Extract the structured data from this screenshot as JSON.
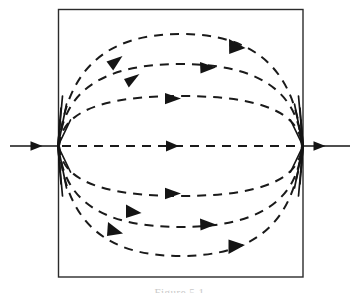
{
  "figure": {
    "name": "phase-portrait-heteroclinic",
    "title": "",
    "caption": "Figure 5.1",
    "background_color": "#ffffff",
    "stroke_color": "#1a1a1a",
    "border_color": "#2b2b2b",
    "caption_color": "#c9c9c9"
  },
  "frame": {
    "x": 58,
    "y": 9,
    "width": 245,
    "height": 268,
    "stroke_width": 1.4
  },
  "chart_data": {
    "type": "scatter",
    "title": "",
    "subtitle": "",
    "xlabel": "",
    "ylabel": "",
    "xlim": [
      0,
      359
    ],
    "ylim": [
      0,
      293
    ],
    "grid": false,
    "legend": null,
    "annotations": [],
    "fixed_points": [
      {
        "name": "left-node",
        "x": 58,
        "y": 146,
        "type": "saddle-node",
        "flow": "source"
      },
      {
        "name": "right-node",
        "x": 303,
        "y": 146,
        "type": "saddle-node",
        "flow": "sink"
      }
    ],
    "axis_line": {
      "y": 146,
      "x_start": 10,
      "x_end": 350,
      "style": "solid-outside-dashed-inside",
      "arrow_positions": [
        38,
        178,
        320
      ],
      "direction": "rightward"
    },
    "trajectories": [
      {
        "name": "arc-upper-3",
        "apex_y": 34,
        "side": "above",
        "arrow_x": [
          118,
          232
        ]
      },
      {
        "name": "arc-upper-2",
        "apex_y": 64,
        "side": "above",
        "arrow_x": [
          137,
          208
        ]
      },
      {
        "name": "arc-upper-1",
        "apex_y": 96,
        "side": "above",
        "arrow_x": [
          177
        ]
      },
      {
        "name": "arc-center",
        "apex_y": 146,
        "side": "center",
        "arrow_x": [
          178
        ]
      },
      {
        "name": "arc-lower-1",
        "apex_y": 196,
        "side": "below",
        "arrow_x": [
          177
        ]
      },
      {
        "name": "arc-lower-2",
        "apex_y": 227,
        "side": "below",
        "arrow_x": [
          137,
          208
        ]
      },
      {
        "name": "arc-lower-3",
        "apex_y": 256,
        "side": "below",
        "arrow_x": [
          118,
          232
        ]
      }
    ],
    "dash_pattern": "9 7",
    "stroke_width": 2.0,
    "arrow_count": 13
  }
}
